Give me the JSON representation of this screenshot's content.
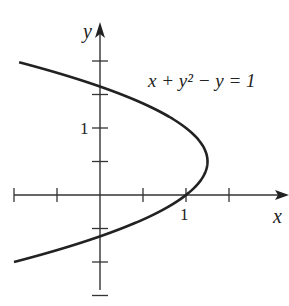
{
  "chart_data": {
    "type": "line",
    "title": "",
    "xlabel": "x",
    "ylabel": "y",
    "annotation": "x + y² − y = 1",
    "equation": "x = 1 + y − y²",
    "x_tick_labels": [
      {
        "value": 1,
        "label": "1"
      }
    ],
    "y_tick_labels": [
      {
        "value": 1,
        "label": "1"
      }
    ],
    "x_ticks": [
      -1,
      -0.5,
      0.5,
      1,
      1.5
    ],
    "y_ticks": [
      -1.5,
      -1,
      -0.5,
      0.5,
      1,
      1.5,
      2
    ],
    "xlim": [
      -1,
      2
    ],
    "ylim": [
      -2,
      2.8
    ],
    "y_range_curve": [
      -1.0,
      1.98
    ],
    "series": [
      {
        "name": "x + y^2 - y = 1",
        "vertex": [
          1.25,
          0.5
        ],
        "x_intercept": 1,
        "y_intercepts": [
          -0.618,
          1.618
        ]
      }
    ],
    "grid": false
  }
}
